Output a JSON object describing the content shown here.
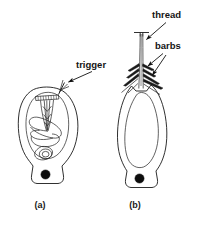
{
  "figure": {
    "background_color": "#ffffff",
    "ink_color": "#1a1a1a",
    "stipple_color": "#6b6b6b"
  },
  "labels": {
    "trigger": "trigger",
    "thread": "thread",
    "barbs": "barbs"
  },
  "panels": [
    {
      "id": "a",
      "caption": "(a)",
      "state": "undischarged",
      "parts": [
        "capsule",
        "operculum",
        "coiled-thread",
        "trigger",
        "nucleus"
      ]
    },
    {
      "id": "b",
      "caption": "(b)",
      "state": "discharged",
      "parts": [
        "capsule",
        "everted-thread",
        "barbs",
        "nucleus"
      ]
    }
  ]
}
